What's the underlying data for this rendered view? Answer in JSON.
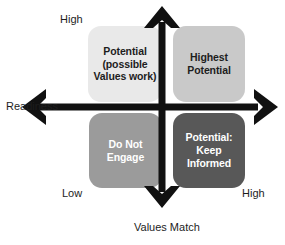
{
  "diagram": {
    "axes": {
      "vertical": {
        "name": "Readiness",
        "high_label": "High",
        "low_label": "Low"
      },
      "horizontal": {
        "name": "Values Match",
        "low_label": "Low",
        "high_label": "High"
      }
    },
    "quadrants": [
      {
        "id": "top-left",
        "label": "Potential\n(possible\nValues work)",
        "fill": "#e9e9e9",
        "text_color": "#1d1d1d"
      },
      {
        "id": "top-right",
        "label": "Highest\nPotential",
        "fill": "#c9c9c9",
        "text_color": "#1d1d1d"
      },
      {
        "id": "bottom-left",
        "label": "Do Not\nEngage",
        "fill": "#9b9b9b",
        "text_color": "#ffffff"
      },
      {
        "id": "bottom-right",
        "label": "Potential:\nKeep\nInformed",
        "fill": "#585858",
        "text_color": "#ffffff"
      }
    ],
    "axis_color": "#111111"
  }
}
